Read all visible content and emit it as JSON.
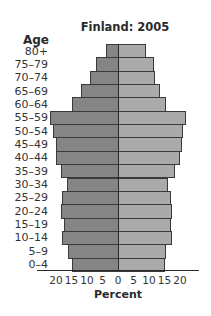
{
  "chart_data": {
    "type": "bar",
    "subtype": "population-pyramid",
    "title": "Finland: 2005",
    "ylabel": "Age",
    "xlabel": "Percent",
    "categories": [
      "80+",
      "75–79",
      "70–74",
      "65–69",
      "60–64",
      "55–59",
      "50–54",
      "45–49",
      "40–44",
      "35–39",
      "30–34",
      "25–29",
      "20–24",
      "15–19",
      "10–14",
      "5–9",
      "0–4"
    ],
    "series": [
      {
        "name": "Left side",
        "side": "left",
        "color": "#858585",
        "values": [
          4,
          7,
          9,
          12,
          15,
          22,
          21,
          20,
          20,
          18.5,
          16.5,
          18,
          18.5,
          17.5,
          18,
          16,
          15
        ]
      },
      {
        "name": "Right side",
        "side": "right",
        "color": "#aaaaaa",
        "values": [
          9,
          11.5,
          12,
          13.5,
          15.5,
          22,
          21,
          20.5,
          20,
          18.5,
          16,
          17,
          17.5,
          17,
          17.5,
          15.5,
          15
        ]
      }
    ],
    "xticks": [
      "20",
      "15",
      "10",
      "5",
      "0",
      "5",
      "10",
      "15",
      "20"
    ],
    "xlim": [
      -25,
      25
    ],
    "grid": false,
    "legend": "none"
  },
  "labels": {
    "title": "Finland: 2005",
    "age": "Age",
    "percent": "Percent"
  }
}
